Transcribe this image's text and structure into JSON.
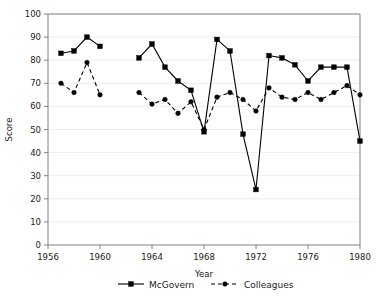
{
  "chart_data": {
    "type": "line",
    "title": "",
    "xlabel": "Year",
    "ylabel": "Score",
    "xlim": [
      1956,
      1980
    ],
    "ylim": [
      0,
      100
    ],
    "xticks": [
      1956,
      1960,
      1964,
      1968,
      1972,
      1976,
      1980
    ],
    "yticks": [
      0,
      10,
      20,
      30,
      40,
      50,
      60,
      70,
      80,
      90,
      100
    ],
    "grid": true,
    "legend_position": "bottom",
    "series": [
      {
        "name": "McGovern",
        "style": "solid",
        "marker": "square",
        "color": "#000000",
        "x": [
          1957,
          1958,
          1959,
          1960,
          1963,
          1964,
          1965,
          1966,
          1967,
          1968,
          1969,
          1970,
          1971,
          1972,
          1973,
          1974,
          1975,
          1976,
          1977,
          1978,
          1979,
          1980
        ],
        "y": [
          83,
          84,
          90,
          86,
          81,
          87,
          77,
          71,
          67,
          49,
          89,
          84,
          48,
          24,
          82,
          81,
          78,
          71,
          77,
          77,
          77,
          45
        ]
      },
      {
        "name": "Colleagues",
        "style": "dashed",
        "marker": "circle",
        "color": "#000000",
        "x": [
          1957,
          1958,
          1959,
          1960,
          1963,
          1964,
          1965,
          1966,
          1967,
          1968,
          1969,
          1970,
          1971,
          1972,
          1973,
          1974,
          1975,
          1976,
          1977,
          1978,
          1979,
          1980
        ],
        "y": [
          70,
          66,
          79,
          65,
          66,
          61,
          63,
          57,
          62,
          50,
          64,
          66,
          63,
          58,
          68,
          64,
          63,
          66,
          63,
          66,
          69,
          65
        ]
      }
    ]
  },
  "axes": {
    "y_label": "Score",
    "x_label": "Year",
    "y_tick_labels": [
      "0",
      "10",
      "20",
      "30",
      "40",
      "50",
      "60",
      "70",
      "80",
      "90",
      "100"
    ],
    "x_tick_labels": [
      "1956",
      "1960",
      "1964",
      "1968",
      "1972",
      "1976",
      "1980"
    ]
  },
  "legend": {
    "entries": [
      {
        "label": "McGovern"
      },
      {
        "label": "Colleagues"
      }
    ]
  }
}
